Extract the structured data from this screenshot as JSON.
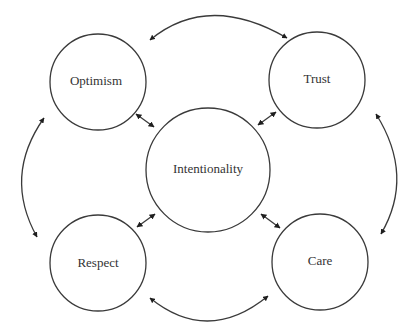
{
  "diagram": {
    "type": "relationship-cycle",
    "center_node": {
      "id": "intentionality",
      "label": "Intentionality"
    },
    "nodes": [
      {
        "id": "optimism",
        "label": "Optimism",
        "position": "top-left"
      },
      {
        "id": "trust",
        "label": "Trust",
        "position": "top-right"
      },
      {
        "id": "respect",
        "label": "Respect",
        "position": "bottom-left"
      },
      {
        "id": "care",
        "label": "Care",
        "position": "bottom-right"
      }
    ],
    "edges": [
      {
        "from": "optimism",
        "to": "trust",
        "direction": "bidirectional",
        "style": "curved"
      },
      {
        "from": "trust",
        "to": "care",
        "direction": "bidirectional",
        "style": "curved"
      },
      {
        "from": "care",
        "to": "respect",
        "direction": "bidirectional",
        "style": "curved"
      },
      {
        "from": "respect",
        "to": "optimism",
        "direction": "bidirectional",
        "style": "curved"
      },
      {
        "from": "intentionality",
        "to": "optimism",
        "direction": "bidirectional",
        "style": "short"
      },
      {
        "from": "intentionality",
        "to": "trust",
        "direction": "bidirectional",
        "style": "short"
      },
      {
        "from": "intentionality",
        "to": "respect",
        "direction": "bidirectional",
        "style": "short"
      },
      {
        "from": "intentionality",
        "to": "care",
        "direction": "bidirectional",
        "style": "short"
      }
    ],
    "colors": {
      "stroke": "#3a3a3a",
      "arrow": "#1e1e1e",
      "text": "#333333",
      "background": "#ffffff"
    }
  }
}
